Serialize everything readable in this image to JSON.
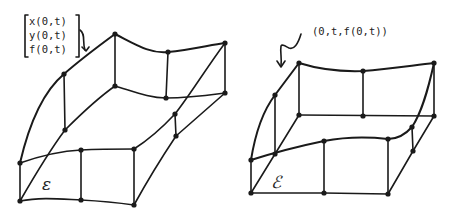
{
  "left_figure": {
    "name": "surface-E",
    "region_label": "ε",
    "annotation_lines": [
      "x(0,t)",
      "y(0,t)",
      "f(0,t)"
    ]
  },
  "right_figure": {
    "name": "surface-S",
    "region_label": "ℰ",
    "annotation": "(0,t,f(0,t))"
  },
  "colors": {
    "ink": "#1a1a1a",
    "background": "#ffffff"
  }
}
